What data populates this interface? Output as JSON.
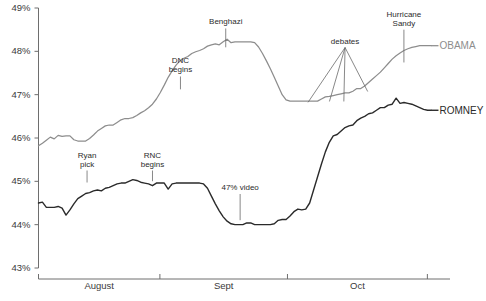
{
  "chart_data": {
    "type": "line",
    "title": "",
    "xlabel": "",
    "ylabel": "",
    "ylim": [
      43,
      49
    ],
    "yticks": [
      43,
      44,
      45,
      46,
      47,
      48,
      49
    ],
    "ytick_labels": [
      "43%",
      "44%",
      "45%",
      "46%",
      "47%",
      "48%",
      "49%"
    ],
    "grid": false,
    "legend_position": "right-inline",
    "x_axis_categories": [
      "August",
      "Sept",
      "Oct"
    ],
    "x_tick_positions": [
      0.0,
      0.295,
      0.605,
      0.945
    ],
    "series": [
      {
        "name": "OBAMA",
        "color": "#8d8d8d",
        "label": "OBAMA",
        "values": [
          45.82,
          45.88,
          45.95,
          46.02,
          45.98,
          46.06,
          46.04,
          46.05,
          46.05,
          45.96,
          45.93,
          45.93,
          45.93,
          45.99,
          46.07,
          46.16,
          46.22,
          46.28,
          46.3,
          46.3,
          46.36,
          46.42,
          46.45,
          46.45,
          46.47,
          46.52,
          46.58,
          46.63,
          46.7,
          46.78,
          46.9,
          47.05,
          47.22,
          47.4,
          47.55,
          47.68,
          47.78,
          47.84,
          47.88,
          47.95,
          47.99,
          48.02,
          48.06,
          48.12,
          48.15,
          48.17,
          48.15,
          48.22,
          48.28,
          48.2,
          48.22,
          48.22,
          48.22,
          48.22,
          48.22,
          48.2,
          48.1,
          47.95,
          47.78,
          47.6,
          47.4,
          47.2,
          47.0,
          46.88,
          46.85,
          46.85,
          46.85,
          46.85,
          46.85,
          46.85,
          46.85,
          46.85,
          46.9,
          46.95,
          46.96,
          46.98,
          47.0,
          47.02,
          47.04,
          47.04,
          47.08,
          47.14,
          47.14,
          47.2,
          47.28,
          47.36,
          47.44,
          47.52,
          47.62,
          47.72,
          47.82,
          47.9,
          47.96,
          48.02,
          48.06,
          48.09,
          48.11,
          48.13,
          48.13,
          48.13,
          48.13
        ]
      },
      {
        "name": "ROMNEY",
        "color": "#2a2a2a",
        "label": "ROMNEY",
        "values": [
          44.5,
          44.52,
          44.4,
          44.4,
          44.4,
          44.42,
          44.38,
          44.22,
          44.34,
          44.48,
          44.6,
          44.66,
          44.72,
          44.74,
          44.78,
          44.8,
          44.78,
          44.84,
          44.86,
          44.9,
          44.94,
          44.96,
          44.96,
          45.0,
          45.04,
          45.02,
          44.98,
          44.96,
          44.94,
          44.9,
          44.96,
          44.96,
          44.96,
          44.82,
          44.94,
          44.96,
          44.96,
          44.96,
          44.96,
          44.96,
          44.96,
          44.96,
          44.94,
          44.84,
          44.66,
          44.48,
          44.32,
          44.18,
          44.08,
          44.02,
          44.0,
          44.0,
          44.0,
          44.04,
          44.04,
          44.0,
          44.0,
          44.0,
          44.0,
          44.0,
          44.02,
          44.1,
          44.12,
          44.12,
          44.2,
          44.3,
          44.36,
          44.34,
          44.36,
          44.5,
          44.8,
          45.1,
          45.4,
          45.68,
          45.9,
          46.05,
          46.08,
          46.16,
          46.24,
          46.28,
          46.3,
          46.4,
          46.46,
          46.5,
          46.56,
          46.58,
          46.64,
          46.7,
          46.7,
          46.76,
          46.78,
          46.92,
          46.8,
          46.82,
          46.8,
          46.78,
          46.74,
          46.7,
          46.66,
          46.64,
          46.64
        ]
      }
    ],
    "annotations": [
      {
        "text_lines": [
          "Ryan",
          "pick"
        ],
        "x_label": 0.118,
        "y_label_pct": 45.55,
        "target_x": 0.118,
        "target_y_pct": 44.95
      },
      {
        "text_lines": [
          "RNC",
          "begins"
        ],
        "x_label": 0.277,
        "y_label_pct": 45.55,
        "target_x": 0.277,
        "target_y_pct": 44.98
      },
      {
        "text_lines": [
          "DNC",
          "begins"
        ],
        "x_label": 0.345,
        "y_label_pct": 47.72,
        "target_x": 0.345,
        "target_y_pct": 47.1
      },
      {
        "text_lines": [
          "Benghazi"
        ],
        "x_label": 0.455,
        "y_label_pct": 48.62,
        "target_x": 0.455,
        "target_y_pct": 48.07
      },
      {
        "text_lines": [
          "47% video"
        ],
        "x_label": 0.49,
        "y_label_pct": 44.8,
        "target_x": 0.49,
        "target_y_pct": 44.08
      },
      {
        "text_lines": [
          "debates"
        ],
        "x_label": 0.745,
        "y_label_pct": 48.18,
        "target_x": 0.745,
        "target_y_pct": 48.18
      },
      {
        "text_lines": [
          "Hurricane",
          "Sandy"
        ],
        "x_label": 0.888,
        "y_label_pct": 48.8,
        "target_x": 0.888,
        "target_y_pct": 47.72
      }
    ],
    "debate_leader_targets": [
      {
        "x": 0.655,
        "y_pct": 46.8
      },
      {
        "x": 0.707,
        "y_pct": 46.82
      },
      {
        "x": 0.742,
        "y_pct": 46.82
      },
      {
        "x": 0.8,
        "y_pct": 47.05
      }
    ]
  }
}
